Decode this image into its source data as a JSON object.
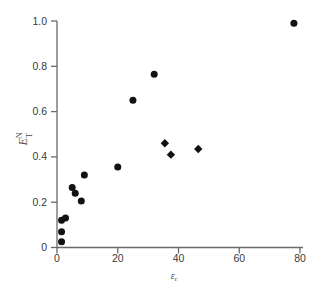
{
  "chart_data": {
    "type": "scatter",
    "title": "",
    "xlabel": "epsilon_r",
    "ylabel": "E_T^N",
    "xlim": [
      0,
      80
    ],
    "ylim": [
      0,
      1.0
    ],
    "x_ticks": [
      0,
      20,
      40,
      60,
      80
    ],
    "x_tick_labels": [
      "0",
      "20",
      "40",
      "60",
      "80"
    ],
    "y_ticks": [
      0,
      0.2,
      0.4,
      0.6,
      0.8,
      1.0
    ],
    "y_tick_labels": [
      "0",
      "0.2",
      "0.4",
      "0.6",
      "0.8",
      "1.0"
    ],
    "grid": false,
    "legend": "none",
    "series": [
      {
        "name": "filled-circles",
        "marker": "circle",
        "points": [
          [
            1.5,
            0.025
          ],
          [
            1.5,
            0.07
          ],
          [
            1.5,
            0.12
          ],
          [
            2.8,
            0.13
          ],
          [
            5,
            0.265
          ],
          [
            6,
            0.24
          ],
          [
            8,
            0.205
          ],
          [
            9,
            0.32
          ],
          [
            20,
            0.355
          ],
          [
            25,
            0.65
          ],
          [
            32,
            0.765
          ],
          [
            78,
            0.99
          ]
        ]
      },
      {
        "name": "filled-diamonds",
        "marker": "diamond",
        "points": [
          [
            35.5,
            0.46
          ],
          [
            37.5,
            0.41
          ],
          [
            46.5,
            0.435
          ]
        ]
      }
    ]
  },
  "labels": {
    "ylabel_base": "E",
    "ylabel_sup": "N",
    "ylabel_sub": "T",
    "xlabel_base": "ε",
    "xlabel_sub": "r"
  },
  "colors": {
    "marker": "#121212",
    "axis": "#6a6a6a",
    "tick_label": "#3a3a3a",
    "axis_label": "#4a4a4a",
    "background": "#ffffff"
  }
}
